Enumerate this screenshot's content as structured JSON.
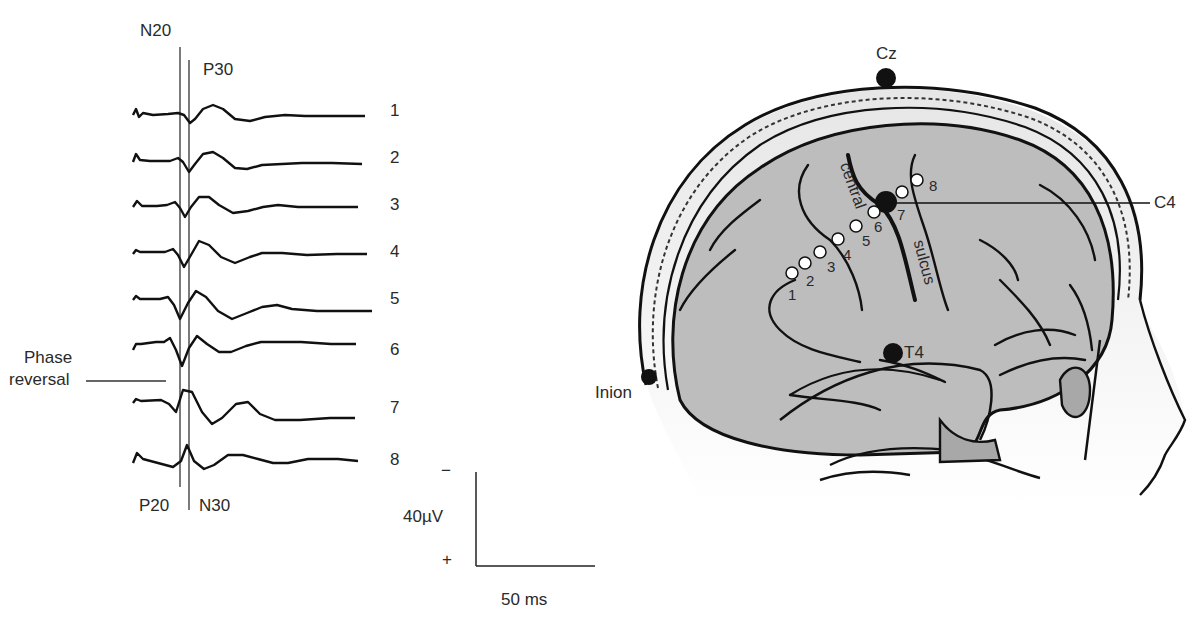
{
  "left_panel": {
    "top_labels": {
      "n20": "N20",
      "p30": "P30"
    },
    "bottom_labels": {
      "p20": "P20",
      "n30": "N30"
    },
    "phase_reversal": {
      "line1": "Phase",
      "line2": "reversal"
    },
    "trace_numbers": [
      "1",
      "2",
      "3",
      "4",
      "5",
      "6",
      "7",
      "8"
    ],
    "scale_bar": {
      "minus": "−",
      "amplitude": "40µV",
      "plus": "+",
      "time": "50 ms"
    }
  },
  "right_panel": {
    "electrodes": {
      "cz": "Cz",
      "c4": "C4",
      "t4": "T4",
      "inion": "Inion"
    },
    "sulcus_labels": {
      "central": "central",
      "sulcus": "sulcus"
    },
    "contact_numbers": [
      "1",
      "2",
      "3",
      "4",
      "5",
      "6",
      "7",
      "8"
    ]
  },
  "colors": {
    "brain_fill": "#bdbdbd",
    "skin_fill": "#e6e6e6",
    "ink": "#111111"
  }
}
